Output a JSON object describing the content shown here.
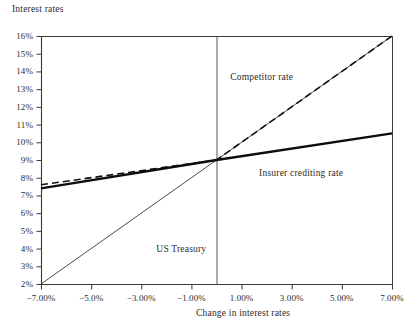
{
  "chart_data": {
    "type": "line",
    "title": "",
    "xlabel": "Change in interest rates",
    "ylabel": "Interest rates",
    "xlim": [
      -7,
      7
    ],
    "ylim": [
      2,
      16
    ],
    "grid": false,
    "legend_position": "inline-annotations",
    "x_tick_labels": [
      "−7.00%",
      "−5.0%",
      "−3.00%",
      "−1.00%",
      "1.00%",
      "3.00%",
      "5.00%",
      "7.00%"
    ],
    "x_tick_values": [
      -7,
      -5,
      -3,
      -1,
      1,
      3,
      5,
      7
    ],
    "y_tick_labels": [
      "16%",
      "15%",
      "14%",
      "13%",
      "12%",
      "11%",
      "10%",
      "9%",
      "8%",
      "7%",
      "6%",
      "5%",
      "4%",
      "3%",
      "2%"
    ],
    "y_tick_values": [
      16,
      15,
      14,
      13,
      12,
      11,
      10,
      9,
      8,
      7,
      6,
      5,
      4,
      3,
      2
    ],
    "reference_line_x": 0,
    "series": [
      {
        "name": "US Treasury",
        "style": "thin-solid",
        "color": "#1a1a1a",
        "width": 0.8,
        "x": [
          -7,
          7
        ],
        "values": [
          2.0,
          16.0
        ],
        "label_x": -2.4,
        "label_y": 3.9
      },
      {
        "name": "Competitor rate",
        "style": "dashed",
        "color": "#111111",
        "width": 1.6,
        "x": [
          -7,
          0,
          7
        ],
        "values": [
          7.6,
          9.0,
          16.0
        ],
        "label_x": 0.55,
        "label_y": 13.65
      },
      {
        "name": "Insurer crediting rate",
        "style": "bold-solid",
        "color": "#0d0d0d",
        "width": 2.4,
        "x": [
          -7,
          0,
          7
        ],
        "values": [
          7.4,
          9.0,
          10.5
        ],
        "label_x": 1.7,
        "label_y": 8.2
      }
    ],
    "crossover_point": {
      "x": 0,
      "y": 9.0
    }
  },
  "plot_area": {
    "left": 41,
    "top": 36,
    "right": 392,
    "bottom": 284
  },
  "colors": {
    "axis": "#3a3a3a",
    "text": "#2b2b2b",
    "background": "#ffffff",
    "reference_line": "#555555"
  }
}
